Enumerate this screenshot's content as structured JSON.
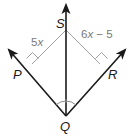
{
  "diagram": {
    "type": "angle-bisector",
    "points": {
      "S": "S",
      "P": "P",
      "R": "R",
      "Q": "Q"
    },
    "measures": {
      "SP": {
        "coef": "5",
        "var": "x",
        "rest": ""
      },
      "SR": {
        "coef": "6",
        "var": "x",
        "rest": " − 5"
      }
    },
    "colors": {
      "ray": "#1a1a1a",
      "perpendicular": "#9a9a9a",
      "label": "#1a1a1a",
      "measure": "#7a7a7a"
    }
  }
}
